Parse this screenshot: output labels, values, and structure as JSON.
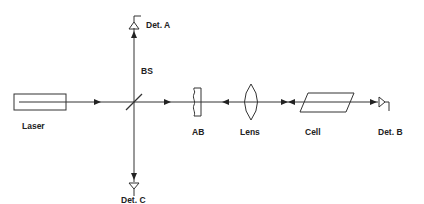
{
  "diagram": {
    "type": "optical-setup",
    "colors": {
      "line": "#333333",
      "background": "#ffffff",
      "text": "#222222"
    },
    "components": {
      "laser": {
        "label": "Laser"
      },
      "beam_splitter": {
        "label": "BS"
      },
      "detector_a": {
        "label": "Det. A"
      },
      "detector_b": {
        "label": "Det. B"
      },
      "detector_c": {
        "label": "Det. C"
      },
      "absorber": {
        "label": "AB"
      },
      "lens": {
        "label": "Lens"
      },
      "cell": {
        "label": "Cell"
      }
    }
  }
}
